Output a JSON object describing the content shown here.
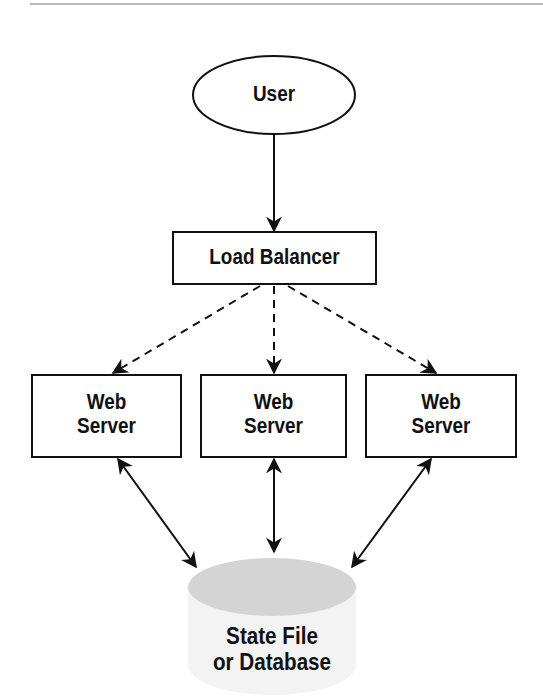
{
  "diagram": {
    "title": "",
    "nodes": [
      {
        "id": "user",
        "label": "User",
        "shape": "ellipse"
      },
      {
        "id": "lb",
        "label": "Load Balancer",
        "shape": "rectangle"
      },
      {
        "id": "ws1",
        "label_line1": "Web",
        "label_line2": "Server",
        "shape": "rectangle"
      },
      {
        "id": "ws2",
        "label_line1": "Web",
        "label_line2": "Server",
        "shape": "rectangle"
      },
      {
        "id": "ws3",
        "label_line1": "Web",
        "label_line2": "Server",
        "shape": "rectangle"
      },
      {
        "id": "db",
        "label_line1": "State File",
        "label_line2": "or Database",
        "shape": "cylinder"
      }
    ],
    "edges": [
      {
        "from": "user",
        "to": "lb",
        "style": "solid",
        "direction": "forward"
      },
      {
        "from": "lb",
        "to": "ws1",
        "style": "dashed",
        "direction": "forward"
      },
      {
        "from": "lb",
        "to": "ws2",
        "style": "dashed",
        "direction": "forward"
      },
      {
        "from": "lb",
        "to": "ws3",
        "style": "dashed",
        "direction": "forward"
      },
      {
        "from": "ws1",
        "to": "db",
        "style": "solid",
        "direction": "both"
      },
      {
        "from": "ws2",
        "to": "db",
        "style": "solid",
        "direction": "both"
      },
      {
        "from": "ws3",
        "to": "db",
        "style": "solid",
        "direction": "both"
      }
    ],
    "colors": {
      "stroke": "#111111",
      "db_top": "#d4d4d4",
      "db_body": "#f3f3f3",
      "rule": "#b8b8b8"
    }
  }
}
